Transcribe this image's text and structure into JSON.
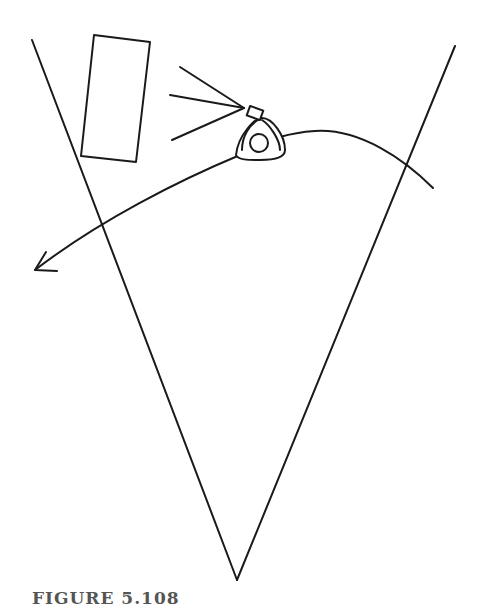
{
  "figure": {
    "caption": "FIGURE 5.108",
    "stroke_color": "#1a1a1a",
    "elements": {
      "view_wedge": {
        "left_top": [
          32,
          40
        ],
        "right_top": [
          455,
          46
        ],
        "vertex": [
          237,
          580
        ]
      },
      "rectangle": {
        "corners": [
          [
            94,
            35
          ],
          [
            150,
            42
          ],
          [
            136,
            162
          ],
          [
            81,
            156
          ]
        ]
      },
      "rays": {
        "origin": [
          243,
          108
        ],
        "ends": [
          [
            180,
            67
          ],
          [
            170,
            95
          ],
          [
            172,
            140
          ]
        ]
      },
      "movement_path": {
        "start": [
          433,
          188
        ],
        "end_arrow_tip": [
          35,
          270
        ]
      }
    }
  }
}
